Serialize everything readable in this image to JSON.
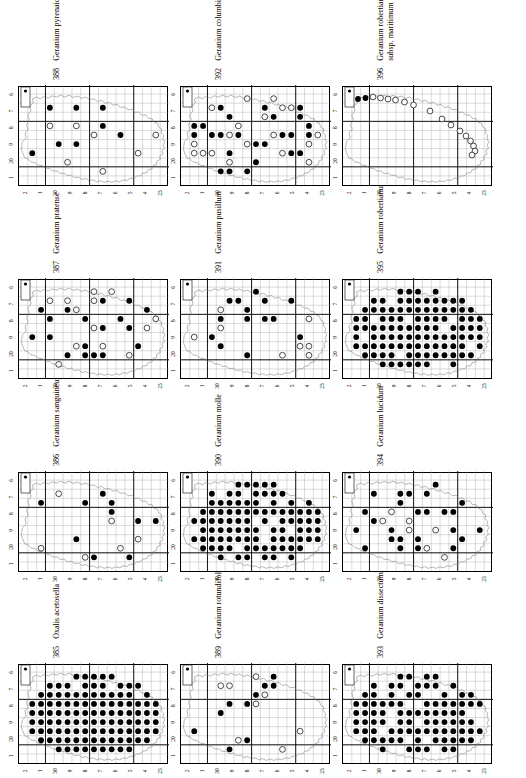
{
  "page": {
    "kind": "distribution-atlas-page",
    "orientation": "landscape-rotated-90ccw",
    "columns": 3,
    "rows": 4,
    "ink": "#000000",
    "paper": "#ffffff",
    "grid_line": "#9a9a9a",
    "major_grid_line": "#000000",
    "coast_line": "#7a7a7a"
  },
  "legend": {
    "filled_symbol": "filled-circle",
    "open_symbol": "open-circle",
    "filled_meaning": "recorded",
    "open_meaning": "old-record"
  },
  "axes": {
    "top_tick_labels": [
      "1",
      "0",
      "9",
      "8",
      "7",
      "6"
    ],
    "top_tick_prefix_on_zero": "2",
    "left_tick_labels": [
      "2",
      "1",
      "0",
      "9",
      "8",
      "7",
      "6",
      "5",
      "4",
      "3"
    ],
    "left_tick_prefix_on_zero": "3",
    "left_tick_prefix_on_three": "2"
  },
  "panels": [
    {
      "number": "385",
      "name": "Oxalis acetosella",
      "name_line2": "",
      "col": 0,
      "row": 3,
      "density": "very-high",
      "filled": 96,
      "open": 0
    },
    {
      "number": "386",
      "name": "Geranium sanguineum",
      "name_line2": "",
      "col": 0,
      "row": 2,
      "density": "low",
      "filled": 12,
      "open": 5
    },
    {
      "number": "387",
      "name": "Geranium pratense",
      "name_line2": "",
      "col": 0,
      "row": 1,
      "density": "medium-low",
      "filled": 26,
      "open": 5
    },
    {
      "number": "388",
      "name": "Geranium pyrenaicum",
      "name_line2": "",
      "col": 0,
      "row": 0,
      "density": "low",
      "filled": 14,
      "open": 3
    },
    {
      "number": "389",
      "name": "Geranium rotundifolium",
      "name_line2": "",
      "col": 1,
      "row": 3,
      "density": "low",
      "filled": 12,
      "open": 10
    },
    {
      "number": "390",
      "name": "Geranium molle",
      "name_line2": "",
      "col": 1,
      "row": 2,
      "density": "high",
      "filled": 78,
      "open": 0
    },
    {
      "number": "391",
      "name": "Geranium pusillum",
      "name_line2": "",
      "col": 1,
      "row": 1,
      "density": "low",
      "filled": 11,
      "open": 8
    },
    {
      "number": "392",
      "name": "Geranium columbinum",
      "name_line2": "",
      "col": 1,
      "row": 0,
      "density": "medium",
      "filled": 30,
      "open": 22
    },
    {
      "number": "393",
      "name": "Geranium dissectum",
      "name_line2": "",
      "col": 2,
      "row": 3,
      "density": "high",
      "filled": 84,
      "open": 0
    },
    {
      "number": "394",
      "name": "Geranium lucidum",
      "name_line2": "",
      "col": 2,
      "row": 2,
      "density": "medium-low",
      "filled": 22,
      "open": 11
    },
    {
      "number": "395",
      "name": "Geranium robertianum",
      "name_line2": "",
      "col": 2,
      "row": 1,
      "density": "very-high",
      "filled": 104,
      "open": 0
    },
    {
      "number": "396",
      "name": "Geranium robertianum",
      "name_line2": "subsp. maritimum",
      "col": 2,
      "row": 0,
      "density": "coastal",
      "filled": 2,
      "open": 17
    }
  ],
  "chart_data": {
    "type": "scatter",
    "xlabel": "",
    "ylabel": "",
    "grid": true,
    "legend_position": "none",
    "note": "Each panel is a 10-km square presence map on a national grid; filled circles = recent records, open circles = older records."
  }
}
